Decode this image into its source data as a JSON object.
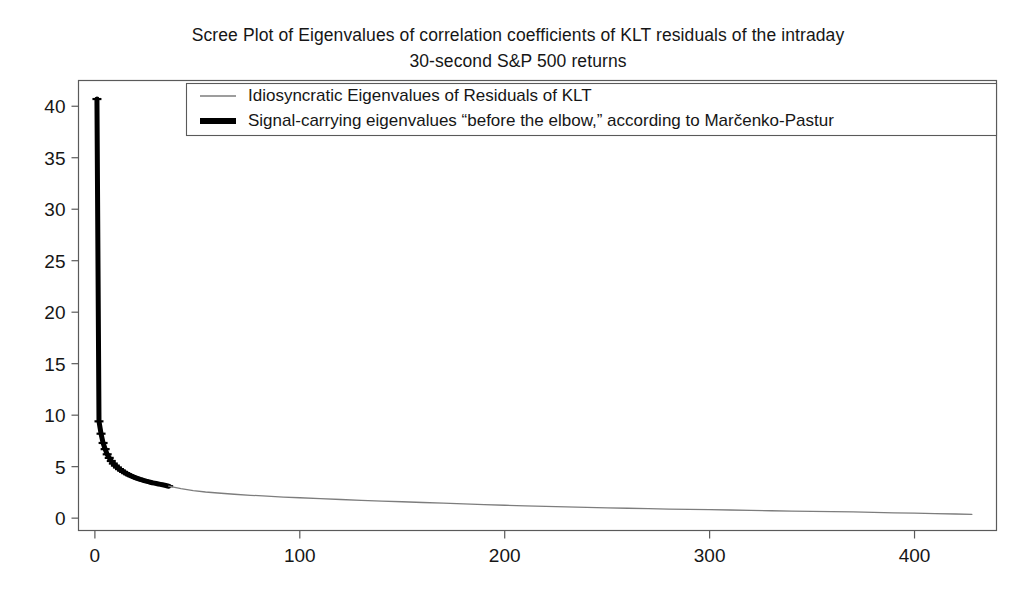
{
  "figure": {
    "title": "Scree Plot of Eigenvalues of correlation coefficients of KLT residuals of the intraday\n30-second S&P 500 returns",
    "background_color": "#ffffff",
    "frame_color": "#5a5a5a"
  },
  "chart_data": {
    "type": "line",
    "title": "Scree Plot of Eigenvalues of correlation coefficients of KLT residuals of the intraday 30-second S&P 500 returns",
    "xlabel": "",
    "ylabel": "",
    "xlim": [
      -8,
      440
    ],
    "ylim": [
      -1.2,
      42.5
    ],
    "xticks": [
      0,
      100,
      200,
      300,
      400
    ],
    "yticks": [
      0,
      5,
      10,
      15,
      20,
      25,
      30,
      35,
      40
    ],
    "grid": false,
    "legend_position": "upper center",
    "series": [
      {
        "name": "Signal-carrying eigenvalues “before the elbow,” according to Marčenko-Pastur",
        "color": "#000000",
        "linewidth": 5,
        "marker": "tick",
        "x": [
          1,
          2,
          3,
          4,
          5,
          6,
          7,
          8,
          9,
          10,
          11,
          12,
          13,
          14,
          15,
          16,
          17,
          18,
          19,
          20,
          21,
          22,
          23,
          24,
          25,
          26,
          27,
          28,
          29,
          30,
          31,
          32,
          33,
          34,
          35,
          36
        ],
        "y": [
          40.7,
          9.4,
          8.2,
          7.3,
          6.7,
          6.2,
          5.85,
          5.55,
          5.3,
          5.1,
          4.92,
          4.76,
          4.62,
          4.49,
          4.37,
          4.26,
          4.16,
          4.07,
          3.99,
          3.91,
          3.84,
          3.77,
          3.71,
          3.65,
          3.59,
          3.54,
          3.49,
          3.44,
          3.4,
          3.36,
          3.32,
          3.28,
          3.24,
          3.2,
          3.15,
          3.1
        ]
      },
      {
        "name": "Idiosyncratic Eigenvalues of Residuals of KLT",
        "color": "#7d7d7d",
        "linewidth": 1.3,
        "marker": "none",
        "x": [
          36,
          42,
          48,
          54,
          60,
          68,
          76,
          84,
          92,
          100,
          110,
          120,
          130,
          140,
          150,
          160,
          170,
          180,
          190,
          200,
          210,
          220,
          230,
          240,
          250,
          260,
          270,
          280,
          290,
          300,
          310,
          320,
          330,
          340,
          350,
          360,
          370,
          380,
          390,
          400,
          410,
          420,
          428
        ],
        "y": [
          3.1,
          2.86,
          2.68,
          2.54,
          2.44,
          2.32,
          2.22,
          2.13,
          2.05,
          1.98,
          1.89,
          1.81,
          1.73,
          1.66,
          1.59,
          1.52,
          1.45,
          1.38,
          1.31,
          1.25,
          1.19,
          1.14,
          1.09,
          1.04,
          1.0,
          0.96,
          0.92,
          0.88,
          0.85,
          0.82,
          0.79,
          0.76,
          0.72,
          0.69,
          0.66,
          0.63,
          0.6,
          0.56,
          0.52,
          0.48,
          0.44,
          0.4,
          0.37
        ]
      }
    ],
    "legend": [
      {
        "label": "Idiosyncratic Eigenvalues of Residuals of KLT",
        "color": "#7d7d7d",
        "style": "thin"
      },
      {
        "label": "Signal-carrying eigenvalues “before the elbow,” according to Marčenko-Pastur",
        "color": "#000000",
        "style": "thick"
      }
    ]
  }
}
